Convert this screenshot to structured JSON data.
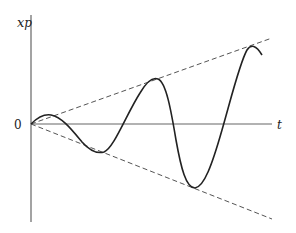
{
  "diagram": {
    "y_axis_label": "x",
    "y_axis_subscript": "p",
    "x_axis_label": "t",
    "origin_label": "0",
    "curve_description": "oscillation with linearly growing amplitude bounded by dashed envelope lines",
    "colors": {
      "axis": "#666666",
      "curve": "#222222",
      "envelope": "#555555"
    }
  }
}
